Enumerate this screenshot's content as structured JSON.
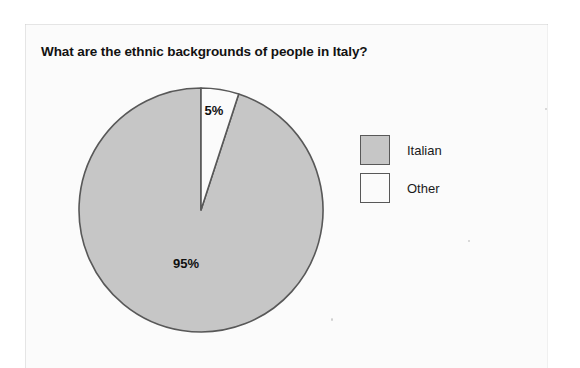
{
  "chart_data": {
    "type": "pie",
    "title": "What are the ethnic backgrounds of people in Italy?",
    "categories": [
      "Italian",
      "Other"
    ],
    "values": [
      95,
      5
    ],
    "unit": "%",
    "data_labels": [
      "95%",
      "5%"
    ],
    "colors": [
      "#c6c6c6",
      "#fbfbfb"
    ],
    "stroke_color": "#585858",
    "start_angle_deg": 0,
    "direction": "clockwise",
    "legend": {
      "position": "right",
      "entries": [
        {
          "label": "Italian",
          "color": "#c6c6c6"
        },
        {
          "label": "Other",
          "color": "#fbfbfb"
        }
      ]
    },
    "grid": false,
    "xlabel": "",
    "ylabel": ""
  },
  "labels": {
    "other_pct": "5%",
    "italian_pct": "95%"
  },
  "geometry": {
    "center_x": 123,
    "center_y": 123,
    "radius": 122
  }
}
